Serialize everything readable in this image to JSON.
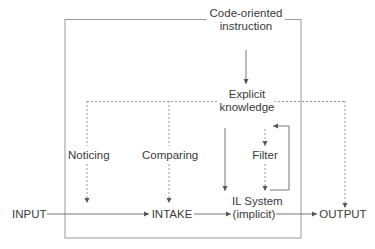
{
  "diagram": {
    "type": "flow",
    "nodes": {
      "instruction": {
        "line1": "Code-oriented",
        "line2": "instruction"
      },
      "explicit": {
        "line1": "Explicit",
        "line2": "knowledge"
      },
      "noticing": "Noticing",
      "comparing": "Comparing",
      "filter": "Filter",
      "input": "INPUT",
      "intake": "INTAKE",
      "il_system": {
        "line1": "IL System",
        "line2": "(implicit)"
      },
      "output": "OUTPUT"
    },
    "edges": [
      {
        "from": "Code-oriented instruction",
        "to": "Explicit knowledge",
        "style": "solid"
      },
      {
        "from": "Explicit knowledge",
        "to": "Noticing",
        "style": "dotted"
      },
      {
        "from": "Explicit knowledge",
        "to": "Comparing",
        "style": "dotted"
      },
      {
        "from": "Explicit knowledge",
        "to": "OUTPUT",
        "style": "dotted"
      },
      {
        "from": "Explicit knowledge",
        "to": "IL System (implicit)",
        "style": "solid"
      },
      {
        "from": "Explicit knowledge",
        "to": "Filter",
        "style": "dotted"
      },
      {
        "from": "Filter",
        "to": "IL System (implicit)",
        "style": "dotted"
      },
      {
        "from": "IL System (implicit)",
        "to": "Filter",
        "style": "solid",
        "note": "feedback loop"
      },
      {
        "from": "Noticing",
        "to": "INPUT-INTAKE line",
        "style": "dotted"
      },
      {
        "from": "Comparing",
        "to": "INTAKE",
        "style": "dotted"
      },
      {
        "from": "INPUT",
        "to": "INTAKE",
        "style": "solid"
      },
      {
        "from": "INTAKE",
        "to": "IL System (implicit)",
        "style": "solid"
      },
      {
        "from": "IL System (implicit)",
        "to": "OUTPUT",
        "style": "solid"
      }
    ],
    "colors": {
      "line": "#8a8a8a",
      "text": "#3a3a3a"
    }
  }
}
